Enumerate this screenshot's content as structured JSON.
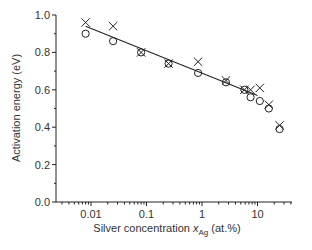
{
  "chart_data": {
    "type": "scatter",
    "title": "",
    "xlabel": "Silver concentration x_Ag (at.%)",
    "xlabel_parts": {
      "pre": "Silver concentration ",
      "var": "x",
      "sub": "Ag",
      "post": " (at.%)"
    },
    "ylabel": "Activation energy (eV)",
    "xscale": "log",
    "xlim": [
      0.002,
      60
    ],
    "ylim": [
      0.0,
      1.0
    ],
    "x_ticks": [
      0.01,
      0.1,
      1,
      10
    ],
    "x_tick_labels": [
      "0.01",
      "0.1",
      "1",
      "10"
    ],
    "y_ticks": [
      0.0,
      0.2,
      0.4,
      0.6,
      0.8,
      1.0
    ],
    "y_tick_labels": [
      "0.0",
      "0.2",
      "0.4",
      "0.6",
      "0.8",
      "1.0"
    ],
    "grid": false,
    "legend": null,
    "series": [
      {
        "name": "crosses",
        "marker": "x",
        "x": [
          0.008,
          0.025,
          0.08,
          0.25,
          0.85,
          2.7,
          5.8,
          7.5,
          11,
          16,
          25
        ],
        "values": [
          0.96,
          0.94,
          0.8,
          0.74,
          0.75,
          0.65,
          0.6,
          0.6,
          0.61,
          0.52,
          0.41
        ]
      },
      {
        "name": "circles",
        "marker": "o",
        "x": [
          0.008,
          0.025,
          0.08,
          0.25,
          0.85,
          2.7,
          5.8,
          7.5,
          11,
          16,
          25
        ],
        "values": [
          0.9,
          0.86,
          0.8,
          0.74,
          0.69,
          0.64,
          0.6,
          0.56,
          0.54,
          0.5,
          0.39
        ]
      },
      {
        "name": "fit",
        "marker": "line",
        "x": [
          0.008,
          10
        ],
        "values": [
          0.94,
          0.57
        ]
      }
    ]
  }
}
